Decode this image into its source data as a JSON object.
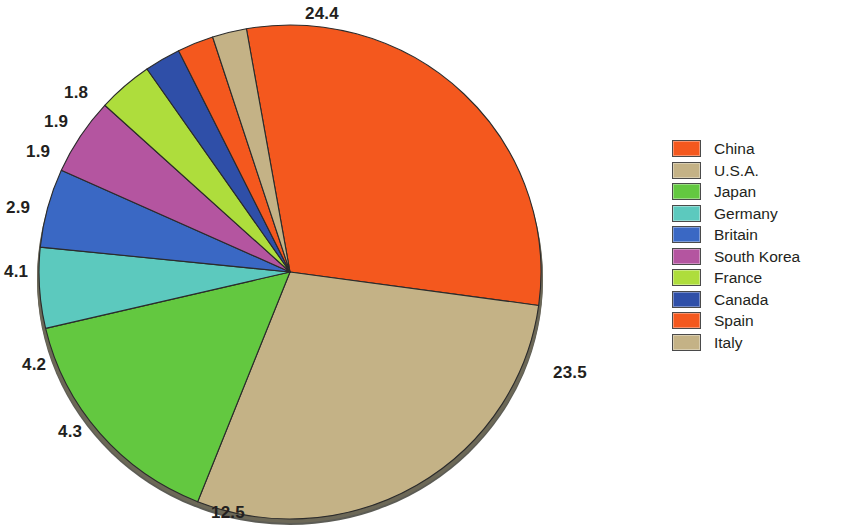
{
  "chart_data": {
    "type": "pie",
    "title": "",
    "subtitle": "",
    "xlabel": "",
    "ylabel": "",
    "grid": false,
    "legend_position": "right",
    "units": "percent",
    "total": 62.0,
    "categories": [
      "China",
      "U.S.A.",
      "Japan",
      "Germany",
      "Britain",
      "South Korea",
      "France",
      "Canada",
      "Spain",
      "Italy"
    ],
    "values": [
      24.4,
      23.5,
      12.5,
      4.3,
      4.2,
      4.1,
      2.9,
      1.9,
      1.9,
      1.8
    ],
    "colors": [
      "#F4581E",
      "#C4B286",
      "#63C840",
      "#5CC9BE",
      "#3A68C4",
      "#B455A0",
      "#AEDD3C",
      "#2F4FA8",
      "#F4581E",
      "#C4B286"
    ],
    "slice_labels": [
      "24.4",
      "23.5",
      "12.5",
      "4.3",
      "4.2",
      "4.1",
      "2.9",
      "1.9",
      "1.9",
      "1.8"
    ],
    "start_angle_deg": -100,
    "direction": "clockwise"
  },
  "legend": {
    "items": [
      {
        "label": "China",
        "color": "#F4581E"
      },
      {
        "label": "U.S.A.",
        "color": "#C4B286"
      },
      {
        "label": "Japan",
        "color": "#63C840"
      },
      {
        "label": "Germany",
        "color": "#5CC9BE"
      },
      {
        "label": "Britain",
        "color": "#3A68C4"
      },
      {
        "label": "South Korea",
        "color": "#B455A0"
      },
      {
        "label": "France",
        "color": "#AEDD3C"
      },
      {
        "label": "Canada",
        "color": "#2F4FA8"
      },
      {
        "label": "Spain",
        "color": "#F4581E"
      },
      {
        "label": "Italy",
        "color": "#C4B286"
      }
    ]
  },
  "labels": {
    "china": "24.4",
    "usa": "23.5",
    "japan": "12.5",
    "germany": "4.3",
    "britain": "4.2",
    "south_korea": "4.1",
    "france": "2.9",
    "canada": "1.9",
    "spain": "1.9",
    "italy": "1.8"
  }
}
